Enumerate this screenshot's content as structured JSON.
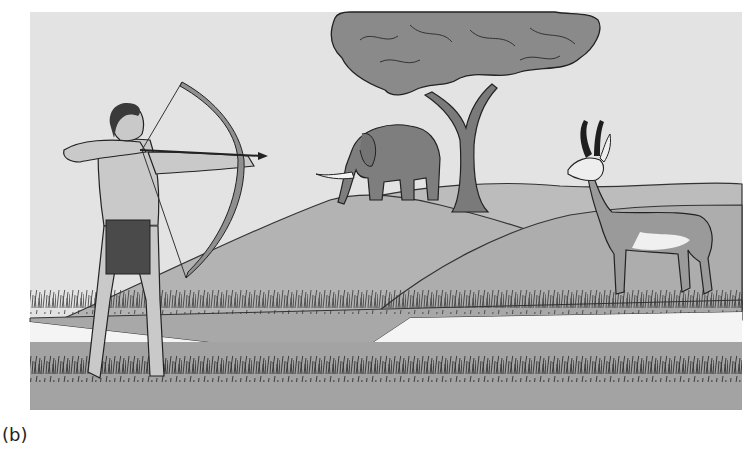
{
  "figure": {
    "caption": "(b)",
    "subjects": [
      "archer",
      "bow-and-arrow",
      "elephant",
      "tree",
      "pronghorn-antelope",
      "grassland-hills"
    ],
    "colors": {
      "sky": "#e3e3e3",
      "hill_far": "#b9b9b9",
      "hill_mid": "#adadad",
      "ground_front": "#a3a3a3",
      "tree_canopy": "#8a8a8a",
      "elephant": "#7e7e7e",
      "skin": "#c9c9c9",
      "loincloth": "#4a4a4a",
      "outline": "#1e1e1e",
      "gap_white": "#f6f6f6"
    }
  }
}
